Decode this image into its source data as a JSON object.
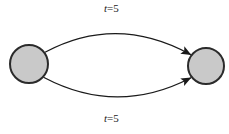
{
  "diagram": {
    "type": "directed-graph",
    "background_color": "#ffffff",
    "nodes": [
      {
        "id": "node-left",
        "label": "",
        "shape": "circle",
        "cx": 29,
        "cy": 64,
        "r": 19,
        "fill_color": "#c9c9c9",
        "stroke_color": "#2b2b2b",
        "stroke_width": 2
      },
      {
        "id": "node-right",
        "label": "",
        "shape": "circle",
        "cx": 206,
        "cy": 66,
        "r": 18,
        "fill_color": "#c9c9c9",
        "stroke_color": "#2b2b2b",
        "stroke_width": 2
      }
    ],
    "edges": [
      {
        "id": "edge-top",
        "from": "node-left",
        "to": "node-right",
        "direction": "left-to-right",
        "curve": "arc-above",
        "stroke_color": "#1a1a1a",
        "stroke_width": 1.2,
        "arrowhead": true,
        "label_variable": "t",
        "label_relation": "=",
        "label_value": "5",
        "label_text": "t=5"
      },
      {
        "id": "edge-bottom",
        "from": "node-left",
        "to": "node-right",
        "direction": "left-to-right",
        "curve": "arc-below",
        "stroke_color": "#1a1a1a",
        "stroke_width": 1.2,
        "arrowhead": true,
        "label_variable": "t",
        "label_relation": "=",
        "label_value": "5",
        "label_text": "t=5"
      }
    ]
  }
}
